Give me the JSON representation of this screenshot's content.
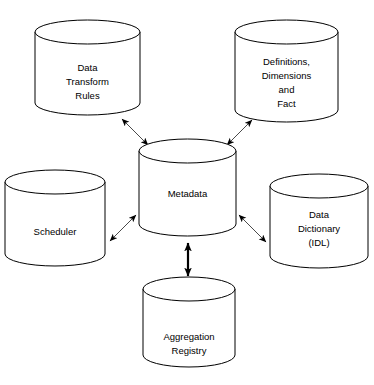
{
  "diagram": {
    "type": "hub-and-spoke",
    "background_color": "#ffffff",
    "stroke_color": "#000000",
    "arrow_color": "#4a4a4a",
    "nodes": [
      {
        "id": "data-transform-rules",
        "shape": "cylinder",
        "lines": [
          "Data",
          "Transform",
          "Rules"
        ],
        "position": "top-left",
        "x": 35,
        "y": 20,
        "w": 105,
        "h": 95
      },
      {
        "id": "definitions-dimensions-fact",
        "shape": "cylinder",
        "lines": [
          "Definitions,",
          "Dimensions",
          "and",
          "Fact"
        ],
        "position": "top-right",
        "x": 235,
        "y": 20,
        "w": 103,
        "h": 102
      },
      {
        "id": "metadata",
        "shape": "cylinder",
        "lines": [
          "Metadata"
        ],
        "position": "center",
        "x": 139,
        "y": 139,
        "w": 97,
        "h": 97
      },
      {
        "id": "scheduler",
        "shape": "cylinder",
        "lines": [
          "Scheduler"
        ],
        "position": "left",
        "x": 5,
        "y": 170,
        "w": 100,
        "h": 96
      },
      {
        "id": "data-dictionary-idl",
        "shape": "cylinder",
        "lines": [
          "Data",
          "Dictionary",
          "(IDL)"
        ],
        "position": "right",
        "x": 270,
        "y": 174,
        "w": 98,
        "h": 94
      },
      {
        "id": "aggregation-registry",
        "shape": "cylinder",
        "lines": [
          "Aggregation",
          "Registry"
        ],
        "position": "bottom",
        "x": 143,
        "y": 277,
        "w": 92,
        "h": 90
      }
    ],
    "connections": [
      {
        "id": "metadata-to-data-transform-rules",
        "from": "metadata",
        "to": "data-transform-rules",
        "style": "double-headed",
        "weight": "thin"
      },
      {
        "id": "metadata-to-definitions-dimensions-fact",
        "from": "metadata",
        "to": "definitions-dimensions-fact",
        "style": "double-headed",
        "weight": "thin"
      },
      {
        "id": "metadata-to-scheduler",
        "from": "metadata",
        "to": "scheduler",
        "style": "double-headed",
        "weight": "thin"
      },
      {
        "id": "metadata-to-data-dictionary-idl",
        "from": "metadata",
        "to": "data-dictionary-idl",
        "style": "double-headed",
        "weight": "thin"
      },
      {
        "id": "metadata-to-aggregation-registry",
        "from": "metadata",
        "to": "aggregation-registry",
        "style": "double-headed",
        "weight": "thick"
      }
    ]
  }
}
